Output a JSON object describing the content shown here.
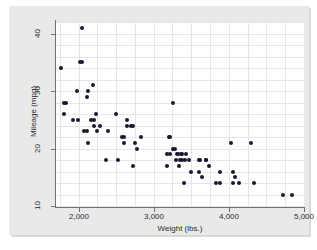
{
  "chart_data": {
    "type": "scatter",
    "title": "",
    "xlabel": "Weight (lbs.)",
    "ylabel": "Mileage (mpg)",
    "xlim": [
      1700,
      5000
    ],
    "ylim": [
      10,
      42
    ],
    "xticks": [
      "2,000",
      "3,000",
      "4,000",
      "5,000"
    ],
    "xtick_values": [
      2000,
      3000,
      4000,
      5000
    ],
    "yticks": [
      "10",
      "20",
      "30",
      "40"
    ],
    "ytick_values": [
      10,
      20,
      30,
      40
    ],
    "grid": true,
    "legend": "none",
    "marker_color": "#1a1a2e",
    "plot_bg": "#ffffff",
    "graph_bg": "#e9e9e9",
    "grid_color": "#e4e6ec",
    "axis_color": "#6f6f7a",
    "n_points": 74,
    "points": [
      {
        "x": 1760,
        "y": 34
      },
      {
        "x": 1800,
        "y": 28
      },
      {
        "x": 1830,
        "y": 28
      },
      {
        "x": 1800,
        "y": 26
      },
      {
        "x": 1930,
        "y": 25
      },
      {
        "x": 1990,
        "y": 25
      },
      {
        "x": 1980,
        "y": 30
      },
      {
        "x": 2050,
        "y": 41
      },
      {
        "x": 2020,
        "y": 35
      },
      {
        "x": 2040,
        "y": 35
      },
      {
        "x": 2070,
        "y": 23
      },
      {
        "x": 2110,
        "y": 23
      },
      {
        "x": 2110,
        "y": 29
      },
      {
        "x": 2120,
        "y": 30
      },
      {
        "x": 2130,
        "y": 21
      },
      {
        "x": 2160,
        "y": 25
      },
      {
        "x": 2190,
        "y": 31
      },
      {
        "x": 2200,
        "y": 25
      },
      {
        "x": 2210,
        "y": 24
      },
      {
        "x": 2230,
        "y": 26
      },
      {
        "x": 2240,
        "y": 23
      },
      {
        "x": 2280,
        "y": 24
      },
      {
        "x": 2370,
        "y": 18
      },
      {
        "x": 2390,
        "y": 23
      },
      {
        "x": 2500,
        "y": 26
      },
      {
        "x": 2520,
        "y": 18
      },
      {
        "x": 2580,
        "y": 22
      },
      {
        "x": 2600,
        "y": 21
      },
      {
        "x": 2610,
        "y": 22
      },
      {
        "x": 2650,
        "y": 25
      },
      {
        "x": 2650,
        "y": 24
      },
      {
        "x": 2700,
        "y": 24
      },
      {
        "x": 2730,
        "y": 24
      },
      {
        "x": 2730,
        "y": 17
      },
      {
        "x": 2750,
        "y": 21
      },
      {
        "x": 2780,
        "y": 20
      },
      {
        "x": 2830,
        "y": 22
      },
      {
        "x": 3180,
        "y": 19
      },
      {
        "x": 3170,
        "y": 17
      },
      {
        "x": 3200,
        "y": 22
      },
      {
        "x": 3210,
        "y": 22
      },
      {
        "x": 3220,
        "y": 19
      },
      {
        "x": 3250,
        "y": 28
      },
      {
        "x": 3260,
        "y": 20
      },
      {
        "x": 3280,
        "y": 20
      },
      {
        "x": 3300,
        "y": 18
      },
      {
        "x": 3310,
        "y": 19
      },
      {
        "x": 3320,
        "y": 19
      },
      {
        "x": 3330,
        "y": 17
      },
      {
        "x": 3350,
        "y": 18
      },
      {
        "x": 3360,
        "y": 19
      },
      {
        "x": 3370,
        "y": 19
      },
      {
        "x": 3380,
        "y": 18
      },
      {
        "x": 3400,
        "y": 14
      },
      {
        "x": 3420,
        "y": 18
      },
      {
        "x": 3430,
        "y": 19
      },
      {
        "x": 3470,
        "y": 18
      },
      {
        "x": 3500,
        "y": 16
      },
      {
        "x": 3600,
        "y": 18
      },
      {
        "x": 3600,
        "y": 16
      },
      {
        "x": 3620,
        "y": 18
      },
      {
        "x": 3640,
        "y": 15
      },
      {
        "x": 3690,
        "y": 18
      },
      {
        "x": 3700,
        "y": 18
      },
      {
        "x": 3740,
        "y": 17
      },
      {
        "x": 3830,
        "y": 14
      },
      {
        "x": 3880,
        "y": 14
      },
      {
        "x": 3880,
        "y": 16
      },
      {
        "x": 4030,
        "y": 21
      },
      {
        "x": 4060,
        "y": 14
      },
      {
        "x": 4060,
        "y": 16
      },
      {
        "x": 4080,
        "y": 15
      },
      {
        "x": 4130,
        "y": 14
      },
      {
        "x": 4290,
        "y": 21
      },
      {
        "x": 4330,
        "y": 14
      },
      {
        "x": 4720,
        "y": 12
      },
      {
        "x": 4840,
        "y": 12
      }
    ]
  }
}
